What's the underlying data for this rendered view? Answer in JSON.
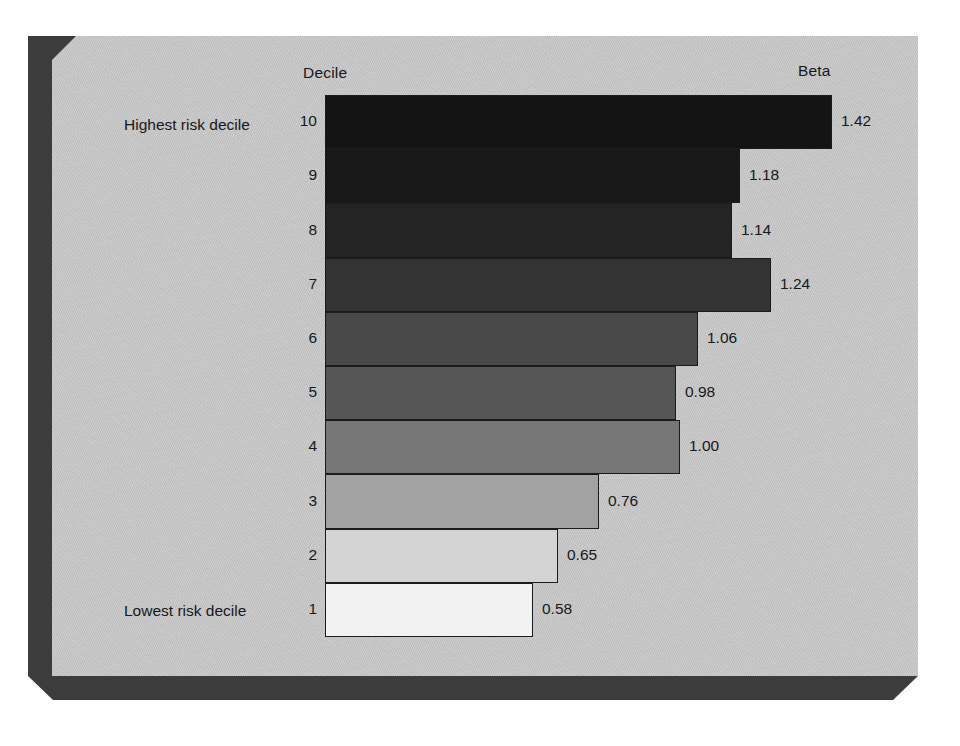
{
  "chart_data": {
    "type": "bar",
    "orientation": "horizontal",
    "title": "",
    "xlabel": "Beta",
    "ylabel": "Decile",
    "column_headers": {
      "left": "Decile",
      "right": "Beta"
    },
    "annotations": {
      "top_label": "Highest risk decile",
      "bottom_label": "Lowest risk decile"
    },
    "categories": [
      "10",
      "9",
      "8",
      "7",
      "6",
      "5",
      "4",
      "3",
      "2",
      "1"
    ],
    "values": [
      1.42,
      1.18,
      1.14,
      1.24,
      1.06,
      0.98,
      1.0,
      0.76,
      0.65,
      0.58
    ],
    "value_labels": [
      "1.42",
      "1.18",
      "1.14",
      "1.24",
      "1.06",
      "0.98",
      "1.00",
      "0.76",
      "0.65",
      "0.58"
    ],
    "xlim": [
      0,
      1.42
    ],
    "grid": false,
    "legend": "none"
  },
  "rows": [
    {
      "decile": "10",
      "value_label": "1.42",
      "bar_px": 507,
      "fill": "#141414"
    },
    {
      "decile": "9",
      "value_label": "1.18",
      "bar_px": 415,
      "fill": "#181818"
    },
    {
      "decile": "8",
      "value_label": "1.14",
      "bar_px": 407,
      "fill": "#242424"
    },
    {
      "decile": "7",
      "value_label": "1.24",
      "bar_px": 446,
      "fill": "#333333"
    },
    {
      "decile": "6",
      "value_label": "1.06",
      "bar_px": 373,
      "fill": "#494949"
    },
    {
      "decile": "5",
      "value_label": "0.98",
      "bar_px": 351,
      "fill": "#565656"
    },
    {
      "decile": "4",
      "value_label": "1.00",
      "bar_px": 355,
      "fill": "#777777"
    },
    {
      "decile": "3",
      "value_label": "0.76",
      "bar_px": 274,
      "fill": "#a2a2a2"
    },
    {
      "decile": "2",
      "value_label": "0.65",
      "bar_px": 233,
      "fill": "#d4d4d4"
    },
    {
      "decile": "1",
      "value_label": "0.58",
      "bar_px": 208,
      "fill": "#f2f2f2"
    }
  ],
  "colors": {
    "panel": "#c9c9c9",
    "shadow": "#3c3c3c",
    "text": "#16181a",
    "bar_outline": "#1b1b1b"
  }
}
